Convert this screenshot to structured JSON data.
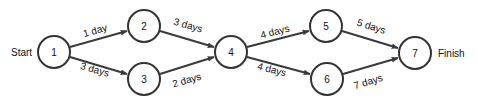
{
  "diagram": {
    "type": "network-diagram",
    "start_label": "Start",
    "finish_label": "Finish",
    "nodes": [
      {
        "id": "1",
        "label": "1",
        "x": 54,
        "y": 52
      },
      {
        "id": "2",
        "label": "2",
        "x": 144,
        "y": 26
      },
      {
        "id": "3",
        "label": "3",
        "x": 144,
        "y": 79
      },
      {
        "id": "4",
        "label": "4",
        "x": 231,
        "y": 52
      },
      {
        "id": "5",
        "label": "5",
        "x": 326,
        "y": 26
      },
      {
        "id": "6",
        "label": "6",
        "x": 327,
        "y": 79
      },
      {
        "id": "7",
        "label": "7",
        "x": 415,
        "y": 53
      }
    ],
    "edges": [
      {
        "from": "1",
        "to": "2",
        "label": "1 day"
      },
      {
        "from": "1",
        "to": "3",
        "label": "3 days"
      },
      {
        "from": "2",
        "to": "4",
        "label": "3 days"
      },
      {
        "from": "3",
        "to": "4",
        "label": "2 days"
      },
      {
        "from": "4",
        "to": "5",
        "label": "4 days"
      },
      {
        "from": "4",
        "to": "6",
        "label": "4 days"
      },
      {
        "from": "5",
        "to": "7",
        "label": "5 days"
      },
      {
        "from": "6",
        "to": "7",
        "label": "7 days"
      }
    ],
    "colors": {
      "stroke": "#333333",
      "text": "#111111",
      "background": "#ffffff"
    }
  }
}
